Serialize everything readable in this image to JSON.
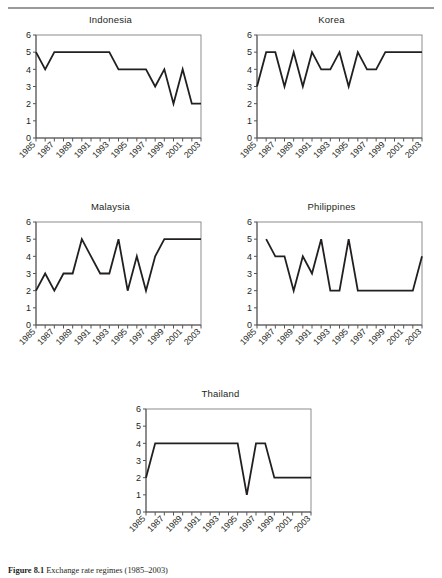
{
  "figure": {
    "caption_label": "Figure 8.1",
    "caption_text": "Exchange rate regimes (1985–2003)",
    "line_color": "#231f20",
    "axis_color": "#808080",
    "text_color": "#231f20"
  },
  "axis": {
    "y_ticks": [
      "0",
      "1",
      "2",
      "3",
      "4",
      "5",
      "6"
    ],
    "y_min": 0,
    "y_max": 6,
    "x_tick_labels": [
      "1985",
      "1987",
      "1989",
      "1991",
      "1993",
      "1995",
      "1997",
      "1999",
      "2001",
      "2003"
    ],
    "x_all_years": [
      1985,
      1986,
      1987,
      1988,
      1989,
      1990,
      1991,
      1992,
      1993,
      1994,
      1995,
      1996,
      1997,
      1998,
      1999,
      2000,
      2001,
      2002,
      2003
    ],
    "x_label_rotation": "-45deg"
  },
  "chart_data": [
    {
      "type": "line",
      "title": "Indonesia",
      "xlabel": "",
      "ylabel": "",
      "ylim": [
        0,
        6
      ],
      "grid": false,
      "legend": "none",
      "x": [
        1985,
        1986,
        1987,
        1988,
        1989,
        1990,
        1991,
        1992,
        1993,
        1994,
        1995,
        1996,
        1997,
        1998,
        1999,
        2000,
        2001,
        2002,
        2003
      ],
      "values": [
        5,
        4,
        5,
        5,
        5,
        5,
        5,
        5,
        5,
        4,
        4,
        4,
        4,
        3,
        4,
        2,
        4,
        2,
        2
      ]
    },
    {
      "type": "line",
      "title": "Korea",
      "xlabel": "",
      "ylabel": "",
      "ylim": [
        0,
        6
      ],
      "grid": false,
      "legend": "none",
      "x": [
        1985,
        1986,
        1987,
        1988,
        1989,
        1990,
        1991,
        1992,
        1993,
        1994,
        1995,
        1996,
        1997,
        1998,
        1999,
        2000,
        2001,
        2002,
        2003
      ],
      "values": [
        3,
        5,
        5,
        3,
        5,
        3,
        5,
        4,
        4,
        5,
        3,
        5,
        4,
        4,
        5,
        5,
        5,
        5,
        5
      ]
    },
    {
      "type": "line",
      "title": "Malaysia",
      "xlabel": "",
      "ylabel": "",
      "ylim": [
        0,
        6
      ],
      "grid": false,
      "legend": "none",
      "x": [
        1985,
        1986,
        1987,
        1988,
        1989,
        1990,
        1991,
        1992,
        1993,
        1994,
        1995,
        1996,
        1997,
        1998,
        1999,
        2000,
        2001,
        2002,
        2003
      ],
      "values": [
        2,
        3,
        2,
        3,
        3,
        5,
        4,
        3,
        3,
        5,
        2,
        4,
        2,
        4,
        5,
        5,
        5,
        5,
        5
      ]
    },
    {
      "type": "line",
      "title": "Philippines",
      "xlabel": "",
      "ylabel": "",
      "ylim": [
        0,
        6
      ],
      "grid": false,
      "legend": "none",
      "x": [
        1986,
        1987,
        1988,
        1989,
        1990,
        1991,
        1992,
        1993,
        1994,
        1995,
        1996,
        1997,
        1998,
        1999,
        2000,
        2001,
        2002,
        2003
      ],
      "values": [
        5,
        4,
        4,
        2,
        4,
        3,
        5,
        2,
        2,
        5,
        2,
        2,
        2,
        2,
        2,
        2,
        2,
        4
      ]
    },
    {
      "type": "line",
      "title": "Thailand",
      "xlabel": "",
      "ylabel": "",
      "ylim": [
        0,
        6
      ],
      "grid": false,
      "legend": "none",
      "x": [
        1985,
        1986,
        1987,
        1988,
        1989,
        1990,
        1991,
        1992,
        1993,
        1994,
        1995,
        1996,
        1997,
        1998,
        1999,
        2000,
        2001,
        2002,
        2003
      ],
      "values": [
        2,
        4,
        4,
        4,
        4,
        4,
        4,
        4,
        4,
        4,
        4,
        1,
        4,
        4,
        2,
        2,
        2,
        2,
        2
      ]
    }
  ]
}
